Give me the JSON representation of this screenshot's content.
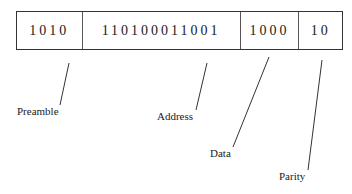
{
  "diagram": {
    "fields": [
      {
        "name": "preamble",
        "bits": "1010",
        "width": 66
      },
      {
        "name": "address",
        "bits": "110100011001",
        "width": 159
      },
      {
        "name": "data",
        "bits": "1000",
        "width": 59
      },
      {
        "name": "parity",
        "bits": "10",
        "width": 43
      }
    ],
    "labels": [
      {
        "text": "Preamble",
        "x": 17,
        "y": 105
      },
      {
        "text": "Address",
        "x": 157,
        "y": 110
      },
      {
        "text": "Data",
        "x": 210,
        "y": 147
      },
      {
        "text": "Parity",
        "x": 279,
        "y": 170
      }
    ],
    "leaders": [
      {
        "x1": 69,
        "y1": 63,
        "x2": 60,
        "y2": 105
      },
      {
        "x1": 207,
        "y1": 63,
        "x2": 196,
        "y2": 110
      },
      {
        "x1": 269,
        "y1": 57,
        "x2": 233,
        "y2": 147
      },
      {
        "x1": 322,
        "y1": 60,
        "x2": 308,
        "y2": 170
      }
    ]
  }
}
